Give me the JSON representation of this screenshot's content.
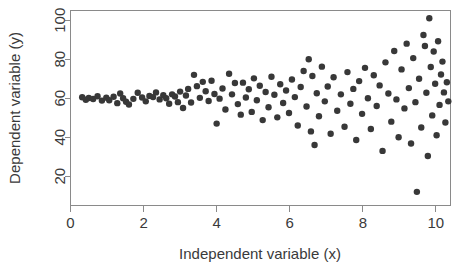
{
  "chart_data": {
    "type": "scatter",
    "title": "",
    "xlabel": "Independent variable (x)",
    "ylabel": "Dependent variable (y)",
    "xlim": [
      0,
      10.4
    ],
    "ylim": [
      5,
      105
    ],
    "xticks": [
      0,
      2,
      4,
      6,
      8,
      10
    ],
    "xticklabels": [
      "0",
      "2",
      "4",
      "6",
      "8",
      "10"
    ],
    "yticks": [
      20,
      40,
      60,
      80,
      100
    ],
    "yticklabels": [
      "20",
      "40",
      "60",
      "80",
      "100"
    ],
    "grid": false,
    "legend": false,
    "marker": "filled-circle",
    "marker_color": "#383838",
    "marker_size_px": 3.2,
    "frame": "box",
    "series": [
      {
        "name": "observations",
        "points": [
          [
            0.32,
            60.5
          ],
          [
            0.42,
            59.2
          ],
          [
            0.5,
            60.1
          ],
          [
            0.62,
            59.6
          ],
          [
            0.74,
            61.0
          ],
          [
            0.86,
            58.8
          ],
          [
            0.98,
            60.3
          ],
          [
            1.06,
            59.0
          ],
          [
            1.18,
            60.8
          ],
          [
            1.28,
            57.5
          ],
          [
            1.36,
            62.4
          ],
          [
            1.44,
            60.0
          ],
          [
            1.52,
            58.2
          ],
          [
            1.6,
            56.8
          ],
          [
            1.72,
            59.7
          ],
          [
            1.84,
            62.8
          ],
          [
            1.96,
            60.4
          ],
          [
            2.06,
            58.4
          ],
          [
            2.16,
            61.2
          ],
          [
            2.26,
            60.6
          ],
          [
            2.34,
            63.0
          ],
          [
            2.44,
            59.4
          ],
          [
            2.54,
            61.6
          ],
          [
            2.62,
            60.0
          ],
          [
            2.7,
            57.2
          ],
          [
            2.78,
            62.0
          ],
          [
            2.86,
            60.9
          ],
          [
            2.94,
            58.0
          ],
          [
            3.0,
            63.4
          ],
          [
            3.08,
            55.0
          ],
          [
            3.16,
            61.4
          ],
          [
            3.22,
            64.8
          ],
          [
            3.3,
            57.8
          ],
          [
            3.38,
            72.0
          ],
          [
            3.46,
            66.2
          ],
          [
            3.54,
            60.2
          ],
          [
            3.62,
            68.4
          ],
          [
            3.7,
            63.6
          ],
          [
            3.78,
            58.6
          ],
          [
            3.86,
            69.0
          ],
          [
            3.94,
            62.2
          ],
          [
            4.0,
            47.0
          ],
          [
            4.08,
            59.8
          ],
          [
            4.16,
            65.0
          ],
          [
            4.24,
            54.2
          ],
          [
            4.34,
            72.6
          ],
          [
            4.42,
            62.0
          ],
          [
            4.5,
            67.8
          ],
          [
            4.58,
            57.0
          ],
          [
            4.66,
            51.6
          ],
          [
            4.72,
            68.0
          ],
          [
            4.8,
            60.4
          ],
          [
            4.88,
            64.6
          ],
          [
            4.96,
            53.0
          ],
          [
            5.02,
            70.2
          ],
          [
            5.1,
            59.0
          ],
          [
            5.18,
            66.4
          ],
          [
            5.26,
            48.8
          ],
          [
            5.34,
            63.2
          ],
          [
            5.42,
            55.4
          ],
          [
            5.5,
            71.0
          ],
          [
            5.58,
            61.8
          ],
          [
            5.66,
            50.2
          ],
          [
            5.74,
            67.2
          ],
          [
            5.82,
            57.6
          ],
          [
            5.9,
            64.0
          ],
          [
            5.98,
            52.4
          ],
          [
            6.06,
            69.6
          ],
          [
            6.14,
            60.6
          ],
          [
            6.22,
            46.0
          ],
          [
            6.3,
            65.8
          ],
          [
            6.38,
            74.0
          ],
          [
            6.46,
            55.8
          ],
          [
            6.52,
            80.0
          ],
          [
            6.58,
            43.0
          ],
          [
            6.62,
            71.4
          ],
          [
            6.68,
            36.0
          ],
          [
            6.74,
            62.6
          ],
          [
            6.8,
            50.8
          ],
          [
            6.88,
            76.2
          ],
          [
            6.96,
            58.4
          ],
          [
            7.04,
            66.0
          ],
          [
            7.12,
            41.8
          ],
          [
            7.2,
            70.8
          ],
          [
            7.3,
            53.6
          ],
          [
            7.4,
            62.0
          ],
          [
            7.5,
            45.4
          ],
          [
            7.58,
            73.4
          ],
          [
            7.66,
            57.2
          ],
          [
            7.74,
            64.8
          ],
          [
            7.82,
            38.6
          ],
          [
            7.9,
            68.8
          ],
          [
            7.98,
            52.0
          ],
          [
            8.06,
            75.6
          ],
          [
            8.14,
            60.0
          ],
          [
            8.22,
            44.2
          ],
          [
            8.3,
            71.8
          ],
          [
            8.38,
            56.0
          ],
          [
            8.46,
            66.6
          ],
          [
            8.54,
            33.0
          ],
          [
            8.62,
            78.4
          ],
          [
            8.7,
            62.4
          ],
          [
            8.78,
            48.0
          ],
          [
            8.86,
            84.2
          ],
          [
            8.92,
            59.4
          ],
          [
            8.98,
            40.0
          ],
          [
            9.06,
            74.8
          ],
          [
            9.14,
            54.8
          ],
          [
            9.2,
            88.0
          ],
          [
            9.26,
            65.2
          ],
          [
            9.32,
            36.8
          ],
          [
            9.38,
            80.6
          ],
          [
            9.44,
            58.0
          ],
          [
            9.48,
            12.0
          ],
          [
            9.54,
            70.0
          ],
          [
            9.6,
            45.0
          ],
          [
            9.66,
            92.4
          ],
          [
            9.7,
            86.8
          ],
          [
            9.74,
            62.8
          ],
          [
            9.78,
            30.4
          ],
          [
            9.82,
            101.0
          ],
          [
            9.86,
            76.0
          ],
          [
            9.9,
            51.2
          ],
          [
            9.94,
            84.0
          ],
          [
            9.98,
            67.4
          ],
          [
            10.02,
            41.0
          ],
          [
            10.06,
            89.2
          ],
          [
            10.1,
            56.6
          ],
          [
            10.14,
            72.2
          ],
          [
            10.18,
            78.8
          ],
          [
            10.22,
            63.0
          ],
          [
            10.26,
            47.6
          ],
          [
            10.3,
            68.2
          ],
          [
            10.34,
            58.4
          ]
        ]
      }
    ]
  },
  "axes": {
    "x_title": "Independent variable (x)",
    "y_title": "Dependent variable (y)"
  }
}
